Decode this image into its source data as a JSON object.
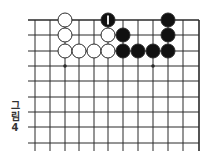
{
  "figure": {
    "caption_lines": [
      "그",
      "림",
      "4"
    ],
    "caption": "그림 4"
  },
  "board": {
    "colors": {
      "line": "#2a2a2a",
      "black": "#111111",
      "white": "#ffffff",
      "mark": "#ffffff"
    },
    "x_lines": [
      35,
      50,
      65,
      79,
      94,
      108,
      123,
      138,
      153,
      168,
      183,
      199
    ],
    "y_lines": [
      20,
      35,
      51,
      66,
      81,
      97,
      112,
      127,
      143
    ],
    "top_edge": true,
    "right_edge": true,
    "star_points": [
      {
        "col": 2,
        "row": 3
      },
      {
        "col": 8,
        "row": 3
      }
    ],
    "stones": [
      {
        "color": "white",
        "col": 2,
        "row": 0
      },
      {
        "color": "black",
        "col": 5,
        "row": 0,
        "label": "1"
      },
      {
        "color": "black",
        "col": 9,
        "row": 0
      },
      {
        "color": "white",
        "col": 2,
        "row": 1
      },
      {
        "color": "white",
        "col": 5,
        "row": 1
      },
      {
        "color": "black",
        "col": 6,
        "row": 1
      },
      {
        "color": "black",
        "col": 9,
        "row": 1
      },
      {
        "color": "white",
        "col": 2,
        "row": 2
      },
      {
        "color": "white",
        "col": 3,
        "row": 2
      },
      {
        "color": "white",
        "col": 4,
        "row": 2
      },
      {
        "color": "white",
        "col": 5,
        "row": 2
      },
      {
        "color": "black",
        "col": 6,
        "row": 2
      },
      {
        "color": "black",
        "col": 7,
        "row": 2
      },
      {
        "color": "black",
        "col": 8,
        "row": 2
      },
      {
        "color": "black",
        "col": 9,
        "row": 2
      }
    ]
  }
}
